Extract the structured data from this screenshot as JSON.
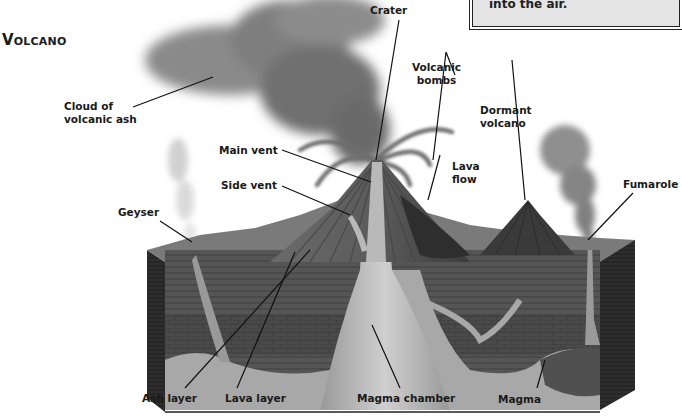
{
  "title": "Volcano",
  "infobox": {
    "text": "into the air."
  },
  "labels": {
    "crater": "Crater",
    "cloud": [
      "Cloud of",
      "volcanic ash"
    ],
    "bombs": [
      "Volcanic",
      "bombs"
    ],
    "dormant": [
      "Dormant",
      "volcano"
    ],
    "main_vent": "Main vent",
    "side_vent": "Side vent",
    "lava_flow": [
      "Lava",
      "flow"
    ],
    "geyser": "Geyser",
    "fumarole": "Fumarole",
    "ash_layer": "Ash layer",
    "lava_layer": "Lava layer",
    "magma_chamber": "Magma chamber",
    "magma": "Magma"
  },
  "colors": {
    "text": "#1a1a1a",
    "ash_cloud": "#8a8a8a",
    "cone": "#5a5a5a",
    "ground_top": "#7a7a7a",
    "strata": "#4e4e4e",
    "magma": "#b4b4b4",
    "box_side": "#2a2a2a"
  }
}
